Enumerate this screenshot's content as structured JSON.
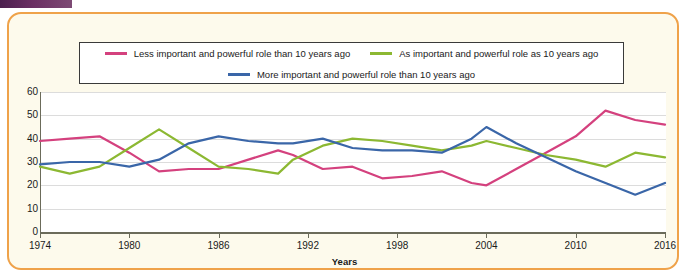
{
  "page": {
    "header_bar_color": "#5b2a57"
  },
  "frame": {
    "border_color": "#efa24a",
    "background_color": "#fdfaec"
  },
  "legend": {
    "items": [
      {
        "label": "Less important and powerful role than 10 years ago",
        "color": "#d4417e",
        "key": "less"
      },
      {
        "label": "As important and powerful role as 10 years ago",
        "color": "#8cb832",
        "key": "as"
      },
      {
        "label": "More important and powerful role than 10 years ago",
        "color": "#3a66a8",
        "key": "more"
      }
    ]
  },
  "axis": {
    "y_ticks": [
      "60",
      "50",
      "40",
      "30",
      "20",
      "10",
      "0"
    ],
    "x_ticks": [
      "1974",
      "1980",
      "1986",
      "1992",
      "1998",
      "2004",
      "2010",
      "2016"
    ],
    "x_title": "Years"
  },
  "chart_data": {
    "type": "line",
    "title": "",
    "xlabel": "Years",
    "ylabel": "",
    "xlim": [
      1974,
      2016
    ],
    "ylim": [
      0,
      60
    ],
    "ytick_step": 10,
    "xtick_step": 6,
    "grid": true,
    "legend_position": "top",
    "x": [
      1974,
      1976,
      1978,
      1980,
      1982,
      1984,
      1986,
      1988,
      1990,
      1991,
      1993,
      1995,
      1997,
      1999,
      2001,
      2003,
      2004,
      2006,
      2008,
      2010,
      2012,
      2014,
      2016
    ],
    "series": [
      {
        "name": "Less important and powerful role than 10 years ago",
        "color": "#d4417e",
        "values": [
          39,
          40,
          41,
          34,
          26,
          27,
          27,
          31,
          35,
          33,
          27,
          28,
          23,
          24,
          26,
          21,
          20,
          27,
          34,
          41,
          52,
          48,
          46
        ]
      },
      {
        "name": "As important and powerful role as 10 years ago",
        "color": "#8cb832",
        "values": [
          28,
          25,
          28,
          36,
          44,
          36,
          28,
          27,
          25,
          31,
          37,
          40,
          39,
          37,
          35,
          37,
          39,
          36,
          33,
          31,
          28,
          34,
          32
        ]
      },
      {
        "name": "More important and powerful role than 10 years ago",
        "color": "#3a66a8",
        "values": [
          29,
          30,
          30,
          28,
          31,
          38,
          41,
          39,
          38,
          38,
          40,
          36,
          35,
          35,
          34,
          40,
          45,
          38,
          32,
          26,
          21,
          16,
          21
        ]
      }
    ]
  }
}
